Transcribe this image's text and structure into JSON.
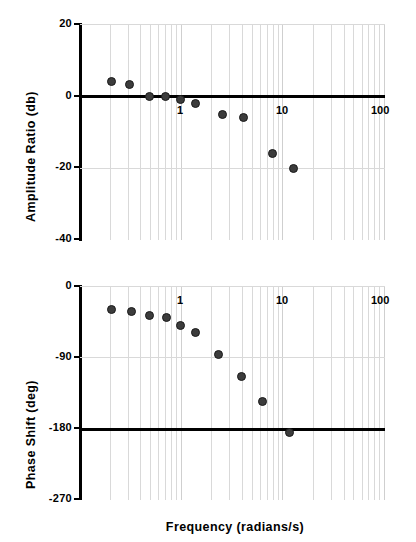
{
  "figure": {
    "title": "",
    "background": "#ffffff",
    "marker_color": "#3c3c3c",
    "axis_color": "#000000",
    "grid_color": "#d9d9d9"
  },
  "xaxis": {
    "label": "Frequency   (radians/s)",
    "scale": "log",
    "min": 0.1,
    "max": 100,
    "ticks": [
      {
        "value": 1,
        "label": "1"
      },
      {
        "value": 10,
        "label": "10"
      },
      {
        "value": 100,
        "label": "100"
      }
    ],
    "minor_decades": [
      0.1,
      1,
      10
    ],
    "minor_multipliers": [
      2,
      3,
      4,
      5,
      6,
      7,
      8,
      9
    ]
  },
  "chart_data": [
    {
      "type": "scatter",
      "title": "",
      "xlabel": "Frequency   (radians/s)",
      "ylabel": "Amplitude Ratio  (db)",
      "xscale": "log",
      "xlim": [
        0.1,
        100
      ],
      "ylim": [
        -40,
        20
      ],
      "yticks": [
        20,
        0,
        -20,
        -40
      ],
      "ytick_labels": [
        "20",
        "0",
        "-20",
        "-40"
      ],
      "grid": true,
      "legend": "none",
      "zero_line": 0,
      "x": [
        0.21,
        0.32,
        0.5,
        0.72,
        1.0,
        1.4,
        2.6,
        4.2,
        8.0,
        13.0
      ],
      "y": [
        4.0,
        3.0,
        -0.2,
        -0.2,
        -1.2,
        -2.2,
        -5.2,
        -6.0,
        -16.2,
        -20.2
      ]
    },
    {
      "type": "scatter",
      "title": "",
      "xlabel": "Frequency   (radians/s)",
      "ylabel": "Phase Shift  (deg)",
      "xscale": "log",
      "xlim": [
        0.1,
        100
      ],
      "ylim": [
        -270,
        0
      ],
      "yticks": [
        0,
        -90,
        -180,
        -270
      ],
      "ytick_labels": [
        "0",
        "-90",
        "-180",
        "-270"
      ],
      "grid": true,
      "legend": "none",
      "reference_line": -180,
      "x": [
        0.21,
        0.33,
        0.5,
        0.73,
        1.0,
        1.4,
        2.4,
        4.0,
        6.5,
        12.0
      ],
      "y": [
        -30,
        -33,
        -38,
        -41,
        -50,
        -59,
        -87,
        -115,
        -146,
        -185
      ]
    }
  ],
  "panels": {
    "amplitude": {
      "ylabel": "Amplitude Ratio  (db)",
      "ytick_labels": [
        "20",
        "0",
        "-20",
        "-40"
      ],
      "xtick_labels": [
        "1",
        "10",
        "100"
      ]
    },
    "phase": {
      "ylabel": "Phase Shift  (deg)",
      "ytick_labels": [
        "0",
        "-90",
        "-180",
        "-270"
      ],
      "xtick_labels": [
        "1",
        "10",
        "100"
      ],
      "xlabel": "Frequency   (radians/s)"
    }
  }
}
